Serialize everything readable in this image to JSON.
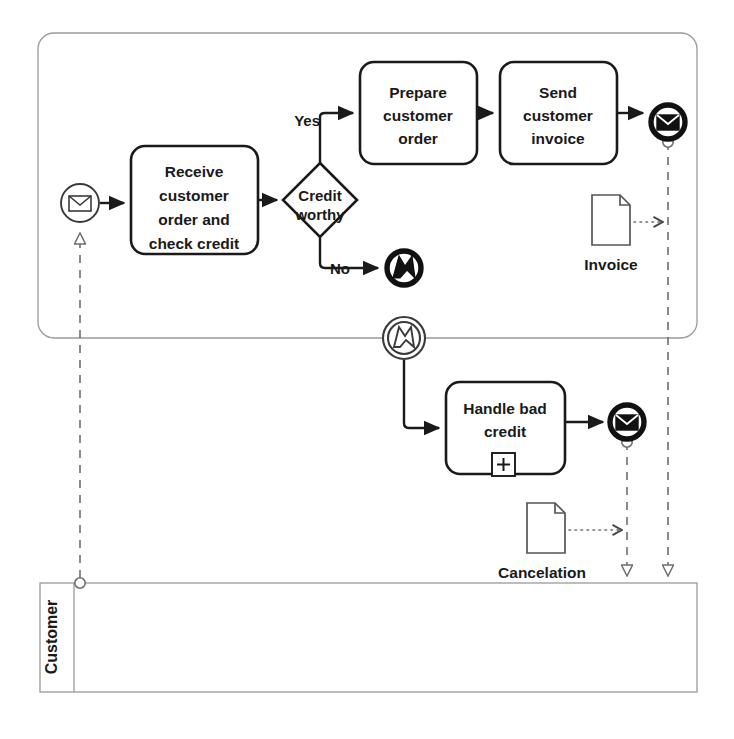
{
  "diagram": {
    "type": "bpmn-process-diagram",
    "colors": {
      "stroke": "#1a1a1a",
      "pool_stroke": "#9a9a9a",
      "message_flow": "#6e6e6e",
      "background": "#ffffff"
    }
  },
  "pools": [
    {
      "id": "supplier-pool",
      "label": "",
      "x": 38,
      "y": 33,
      "w": 659,
      "h": 305
    },
    {
      "id": "customer-pool",
      "label": "Customer",
      "x": 40,
      "y": 583,
      "w": 657,
      "h": 109
    }
  ],
  "events": [
    {
      "id": "start-order-received",
      "name": "message-start-event",
      "kind": "message-start",
      "label": "",
      "cx": 80,
      "cy": 203
    },
    {
      "id": "end-send-invoice",
      "name": "message-end-event",
      "kind": "message-end",
      "label": "",
      "cx": 668,
      "cy": 122
    },
    {
      "id": "end-credit-error",
      "name": "error-end-event",
      "kind": "error-end",
      "label": "",
      "cx": 404,
      "cy": 268
    },
    {
      "id": "start-credit-error",
      "name": "error-start-event",
      "kind": "error-start",
      "label": "",
      "cx": 404,
      "cy": 338
    },
    {
      "id": "end-send-cancelation",
      "name": "message-end-event",
      "kind": "message-end",
      "label": "",
      "cx": 627,
      "cy": 422
    }
  ],
  "tasks": [
    {
      "id": "task-receive",
      "label": "Receive customer order and check credit",
      "lines": [
        "Receive",
        "customer",
        "order and",
        "check credit"
      ],
      "x": 131,
      "y": 146,
      "w": 127,
      "h": 108,
      "marker": "none"
    },
    {
      "id": "task-prepare",
      "label": "Prepare customer order",
      "lines": [
        "Prepare",
        "customer",
        "order"
      ],
      "x": 360,
      "y": 62,
      "w": 117,
      "h": 102,
      "marker": "none"
    },
    {
      "id": "task-send-invoice",
      "label": "Send customer invoice",
      "lines": [
        "Send",
        "customer",
        "invoice"
      ],
      "x": 500,
      "y": 62,
      "w": 117,
      "h": 102,
      "marker": "none"
    },
    {
      "id": "subprocess-handle-bad-credit",
      "label": "Handle bad credit",
      "lines": [
        "Handle bad",
        "credit"
      ],
      "x": 446,
      "y": 382,
      "w": 119,
      "h": 92,
      "marker": "collapsed-subprocess-plus"
    }
  ],
  "gateways": [
    {
      "id": "gateway-credit-worthy",
      "label": "Credit worthy",
      "lines": [
        "Credit",
        "worthy"
      ],
      "cx": 320,
      "cy": 200,
      "r": 37
    }
  ],
  "flow_labels": [
    {
      "id": "flow-label-yes",
      "text": "Yes",
      "x": 322,
      "y": 122
    },
    {
      "id": "flow-label-no",
      "text": "No",
      "x": 348,
      "y": 268
    }
  ],
  "data_objects": [
    {
      "id": "data-invoice",
      "label": "Invoice",
      "x": 592,
      "y": 195,
      "w": 38,
      "h": 50
    },
    {
      "id": "data-cancelation",
      "label": "Cancelation",
      "x": 527,
      "y": 503,
      "w": 38,
      "h": 50
    }
  ],
  "sequence_flows": [
    {
      "id": "sf-start-to-receive",
      "from": "start-order-received",
      "to": "task-receive"
    },
    {
      "id": "sf-receive-to-gateway",
      "from": "task-receive",
      "to": "gateway-credit-worthy"
    },
    {
      "id": "sf-gateway-yes-to-prepare",
      "from": "gateway-credit-worthy",
      "to": "task-prepare",
      "label": "Yes"
    },
    {
      "id": "sf-prepare-to-send-invoice",
      "from": "task-prepare",
      "to": "task-send-invoice"
    },
    {
      "id": "sf-send-invoice-to-end",
      "from": "task-send-invoice",
      "to": "end-send-invoice"
    },
    {
      "id": "sf-gateway-no-to-error-end",
      "from": "gateway-credit-worthy",
      "to": "end-credit-error",
      "label": "No"
    },
    {
      "id": "sf-error-start-to-handle",
      "from": "start-credit-error",
      "to": "subprocess-handle-bad-credit"
    },
    {
      "id": "sf-handle-to-end",
      "from": "subprocess-handle-bad-credit",
      "to": "end-send-cancelation"
    }
  ],
  "message_flows": [
    {
      "id": "mf-customer-to-start",
      "from": "customer-pool",
      "to": "start-order-received"
    },
    {
      "id": "mf-invoice-to-customer",
      "from": "end-send-invoice",
      "to": "customer-pool"
    },
    {
      "id": "mf-cancelation-to-customer",
      "from": "end-send-cancelation",
      "to": "customer-pool"
    }
  ],
  "associations": [
    {
      "id": "assoc-invoice",
      "from": "data-invoice",
      "to": "mf-invoice-to-customer"
    },
    {
      "id": "assoc-cancelation",
      "from": "data-cancelation",
      "to": "mf-cancelation-to-customer"
    }
  ]
}
